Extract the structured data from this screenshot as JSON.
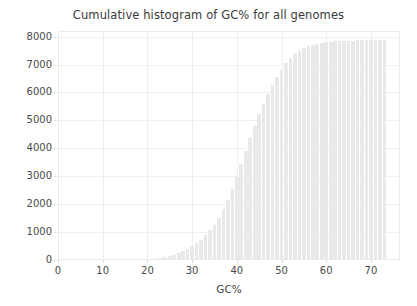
{
  "chart_data": {
    "type": "bar",
    "title": "Cumulative histogram of GC% for all genomes",
    "xlabel": "GC%",
    "ylabel": "",
    "xlim": [
      0,
      76.5
    ],
    "ylim": [
      0,
      8200
    ],
    "grid": true,
    "legend": null,
    "bar_color": "#e9e9e9",
    "xticks": [
      0,
      10,
      20,
      30,
      40,
      50,
      60,
      70
    ],
    "xtick_labels": [
      "0",
      "10",
      "20",
      "30",
      "40",
      "50",
      "60",
      "70"
    ],
    "yticks": [
      0,
      1000,
      2000,
      3000,
      4000,
      5000,
      6000,
      7000,
      8000
    ],
    "ytick_labels": [
      "0",
      "1000",
      "2000",
      "3000",
      "4000",
      "5000",
      "6000",
      "7000",
      "8000"
    ],
    "bar_width": 0.82,
    "x": [
      16,
      17,
      18,
      19,
      20,
      21,
      22,
      23,
      24,
      25,
      26,
      27,
      28,
      29,
      30,
      31,
      32,
      33,
      34,
      35,
      36,
      37,
      38,
      39,
      40,
      41,
      42,
      43,
      44,
      45,
      46,
      47,
      48,
      49,
      50,
      51,
      52,
      53,
      54,
      55,
      56,
      57,
      58,
      59,
      60,
      61,
      62,
      63,
      64,
      65,
      66,
      67,
      68,
      69,
      70,
      71,
      72,
      73
    ],
    "values": [
      6,
      10,
      16,
      24,
      34,
      48,
      66,
      88,
      115,
      150,
      195,
      250,
      315,
      395,
      490,
      600,
      730,
      880,
      1060,
      1270,
      1520,
      1810,
      2150,
      2540,
      2980,
      3440,
      3910,
      4370,
      4810,
      5220,
      5600,
      5950,
      6270,
      6560,
      6820,
      7040,
      7230,
      7380,
      7500,
      7590,
      7660,
      7710,
      7750,
      7780,
      7800,
      7815,
      7828,
      7838,
      7846,
      7852,
      7857,
      7861,
      7864,
      7867,
      7869,
      7871,
      7873,
      7874
    ]
  },
  "axes": {
    "title": "Cumulative histogram of GC% for all genomes",
    "xlabel": "GC%"
  }
}
